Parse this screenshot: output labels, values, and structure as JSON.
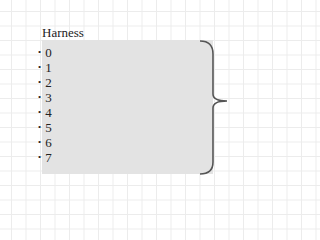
{
  "diagram": {
    "title": "Harness",
    "items": [
      "0",
      "1",
      "2",
      "3",
      "4",
      "5",
      "6",
      "7"
    ],
    "bullet": "•",
    "colors": {
      "box": "#e3e3e3",
      "brace": "#555555",
      "grid": "#ececec"
    }
  }
}
